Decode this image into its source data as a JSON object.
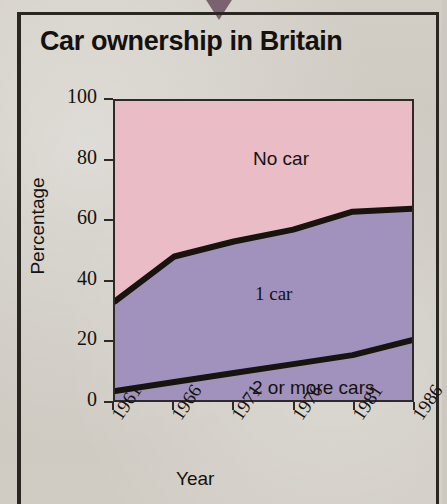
{
  "figure": {
    "title": "Car ownership in Britain",
    "pointer_letter": "D",
    "background_color": "#cdc9c1",
    "frame_color": "#2a2622"
  },
  "chart_data": {
    "type": "area",
    "title": "Car ownership in Britain",
    "xlabel": "Year",
    "ylabel": "Percentage",
    "stacked": true,
    "grid": false,
    "legend_position": "inline-labels",
    "x": [
      1961,
      1966,
      1971,
      1976,
      1981,
      1986
    ],
    "xticklabels": [
      "1961",
      "1966",
      "1971",
      "1976",
      "1981",
      "1986"
    ],
    "xlim": [
      1961,
      1986
    ],
    "ylim": [
      0,
      100
    ],
    "yticks": [
      0,
      20,
      40,
      60,
      80,
      100
    ],
    "yticklabels": [
      "0",
      "20",
      "40",
      "60",
      "80",
      "100"
    ],
    "series": [
      {
        "name": "2 or more cars",
        "color": "#a192bd",
        "values": [
          3,
          6,
          9,
          12,
          15,
          20
        ],
        "cumulative_top": [
          3,
          6,
          9,
          12,
          15,
          20
        ]
      },
      {
        "name": "1 car",
        "color": "#a192bd",
        "values": [
          30,
          42,
          44,
          45,
          48,
          44
        ],
        "cumulative_top": [
          33,
          48,
          53,
          57,
          63,
          64
        ]
      },
      {
        "name": "No car",
        "color": "#e9bcc6",
        "values": [
          67,
          52,
          47,
          43,
          37,
          36
        ],
        "cumulative_top": [
          100,
          100,
          100,
          100,
          100,
          100
        ]
      }
    ],
    "annotations": [
      {
        "text": "No car",
        "series": "No car"
      },
      {
        "text": "1 car",
        "series": "1 car"
      },
      {
        "text": "2 or more cars",
        "series": "2 or more cars"
      }
    ],
    "colors": {
      "no_car_fill": "#e9bcc6",
      "one_car_fill": "#a192bd",
      "two_or_more_fill": "#a192bd",
      "curve_stroke": "#17130f",
      "axis": "#2f2a26"
    }
  }
}
